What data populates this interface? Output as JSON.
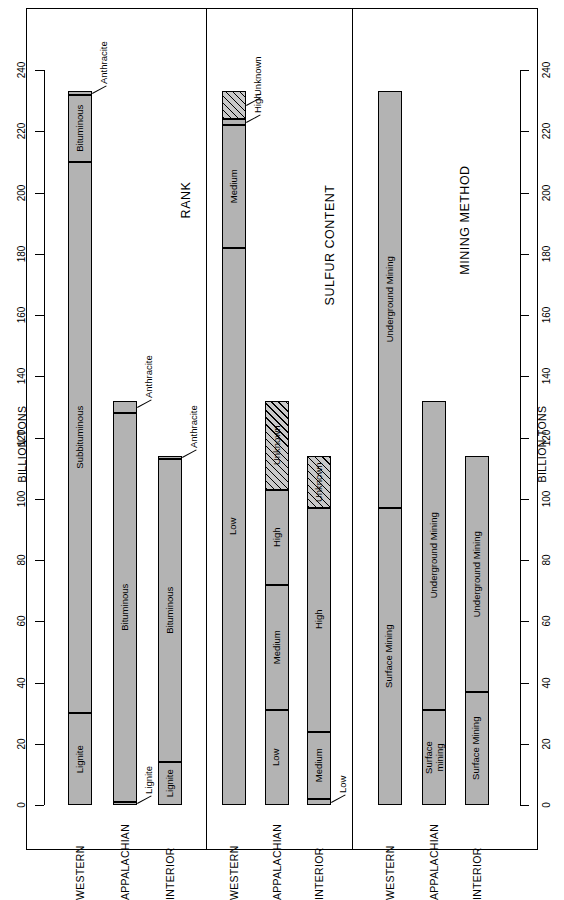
{
  "axis": {
    "title": "BILLION TONS",
    "ticks": [
      0,
      20,
      40,
      60,
      80,
      100,
      120,
      140,
      160,
      180,
      200,
      220,
      240
    ],
    "min": 0,
    "max": 250
  },
  "groups": [
    "WESTERN",
    "APPALACHIAN",
    "INTERIOR"
  ],
  "panels": [
    {
      "title": "RANK"
    },
    {
      "title": "SULFUR CONTENT"
    },
    {
      "title": "MINING METHOD"
    }
  ],
  "chart_data": {
    "type": "bar",
    "orientation": "horizontal",
    "title": "",
    "xlabel": "",
    "ylabel": "BILLION TONS",
    "ylim": [
      0,
      250
    ],
    "grid": false,
    "legend": "none",
    "axis_ticks": [
      0,
      20,
      40,
      60,
      80,
      100,
      120,
      140,
      160,
      180,
      200,
      220,
      240
    ],
    "categories": [
      "WESTERN",
      "APPALACHIAN",
      "INTERIOR"
    ],
    "panels": [
      {
        "title": "RANK",
        "stacks": [
          {
            "category": "WESTERN",
            "total": 233,
            "segments": [
              {
                "label": "Lignite",
                "value": 30,
                "start": 0,
                "end": 30,
                "fill": "solid",
                "label_placement": "inside"
              },
              {
                "label": "Subbituminous",
                "value": 180,
                "start": 30,
                "end": 210,
                "fill": "solid",
                "label_placement": "inside"
              },
              {
                "label": "Bituminous",
                "value": 22,
                "start": 210,
                "end": 232,
                "fill": "solid",
                "label_placement": "inside"
              },
              {
                "label": "Anthracite",
                "value": 1,
                "start": 232,
                "end": 233,
                "fill": "solid",
                "label_placement": "callout"
              }
            ]
          },
          {
            "category": "APPALACHIAN",
            "total": 132,
            "segments": [
              {
                "label": "Lignite",
                "value": 1,
                "start": 0,
                "end": 1,
                "fill": "solid",
                "label_placement": "callout"
              },
              {
                "label": "Bituminous",
                "value": 127,
                "start": 1,
                "end": 128,
                "fill": "solid",
                "label_placement": "inside"
              },
              {
                "label": "Anthracite",
                "value": 4,
                "start": 128,
                "end": 132,
                "fill": "solid",
                "label_placement": "callout"
              }
            ]
          },
          {
            "category": "INTERIOR",
            "total": 114,
            "segments": [
              {
                "label": "Lignite",
                "value": 14,
                "start": 0,
                "end": 14,
                "fill": "solid",
                "label_placement": "inside"
              },
              {
                "label": "Bituminous",
                "value": 99,
                "start": 14,
                "end": 113,
                "fill": "solid",
                "label_placement": "inside"
              },
              {
                "label": "Anthracite",
                "value": 1,
                "start": 113,
                "end": 114,
                "fill": "solid",
                "label_placement": "callout"
              }
            ]
          }
        ]
      },
      {
        "title": "SULFUR CONTENT",
        "stacks": [
          {
            "category": "WESTERN",
            "total": 233,
            "segments": [
              {
                "label": "Low",
                "value": 182,
                "start": 0,
                "end": 182,
                "fill": "solid",
                "label_placement": "inside"
              },
              {
                "label": "Medium",
                "value": 40,
                "start": 182,
                "end": 222,
                "fill": "solid",
                "label_placement": "inside"
              },
              {
                "label": "High",
                "value": 2,
                "start": 222,
                "end": 224,
                "fill": "solid",
                "label_placement": "callout"
              },
              {
                "label": "Unknown",
                "value": 9,
                "start": 224,
                "end": 233,
                "fill": "hatch",
                "label_placement": "callout"
              }
            ]
          },
          {
            "category": "APPALACHIAN",
            "total": 132,
            "segments": [
              {
                "label": "Low",
                "value": 31,
                "start": 0,
                "end": 31,
                "fill": "solid",
                "label_placement": "inside"
              },
              {
                "label": "Medium",
                "value": 41,
                "start": 31,
                "end": 72,
                "fill": "solid",
                "label_placement": "inside"
              },
              {
                "label": "High",
                "value": 31,
                "start": 72,
                "end": 103,
                "fill": "solid",
                "label_placement": "inside"
              },
              {
                "label": "Unknown",
                "value": 29,
                "start": 103,
                "end": 132,
                "fill": "hatch",
                "label_placement": "inside"
              }
            ]
          },
          {
            "category": "INTERIOR",
            "total": 114,
            "segments": [
              {
                "label": "Low",
                "value": 2,
                "start": 0,
                "end": 2,
                "fill": "solid",
                "label_placement": "callout"
              },
              {
                "label": "Medium",
                "value": 22,
                "start": 2,
                "end": 24,
                "fill": "solid",
                "label_placement": "inside"
              },
              {
                "label": "High",
                "value": 73,
                "start": 24,
                "end": 97,
                "fill": "solid",
                "label_placement": "inside"
              },
              {
                "label": "Unknown",
                "value": 17,
                "start": 97,
                "end": 114,
                "fill": "hatch",
                "label_placement": "inside"
              }
            ]
          }
        ]
      },
      {
        "title": "MINING METHOD",
        "stacks": [
          {
            "category": "WESTERN",
            "total": 233,
            "segments": [
              {
                "label": "Surface Mining",
                "value": 97,
                "start": 0,
                "end": 97,
                "fill": "solid",
                "label_placement": "inside"
              },
              {
                "label": "Underground Mining",
                "value": 136,
                "start": 97,
                "end": 233,
                "fill": "solid",
                "label_placement": "inside"
              }
            ]
          },
          {
            "category": "APPALACHIAN",
            "total": 132,
            "segments": [
              {
                "label": "Surface mining",
                "value": 31,
                "start": 0,
                "end": 31,
                "fill": "solid",
                "label_placement": "inside2"
              },
              {
                "label": "Underground Mining",
                "value": 101,
                "start": 31,
                "end": 132,
                "fill": "solid",
                "label_placement": "inside"
              }
            ]
          },
          {
            "category": "INTERIOR",
            "total": 114,
            "segments": [
              {
                "label": "Surface Mining",
                "value": 37,
                "start": 0,
                "end": 37,
                "fill": "solid",
                "label_placement": "inside"
              },
              {
                "label": "Underground Mining",
                "value": 77,
                "start": 37,
                "end": 114,
                "fill": "solid",
                "label_placement": "inside"
              }
            ]
          }
        ]
      }
    ]
  }
}
